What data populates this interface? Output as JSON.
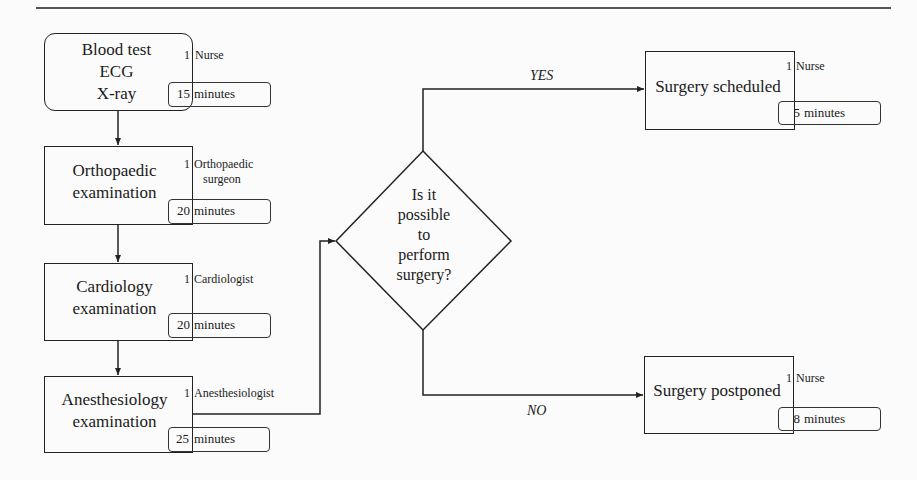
{
  "diagram": {
    "type": "flowchart",
    "steps": [
      {
        "id": "pre-tests",
        "lines": [
          "Blood test",
          "ECG",
          "X-ray"
        ],
        "staff_count": "1",
        "staff_role": "Nurse",
        "duration_value": "15",
        "duration_unit": "minutes"
      },
      {
        "id": "orthopaedic",
        "lines": [
          "Orthopaedic",
          "examination"
        ],
        "staff_count": "1",
        "staff_role_lines": [
          "Orthopaedic",
          "surgeon"
        ],
        "duration_value": "20",
        "duration_unit": "minutes"
      },
      {
        "id": "cardiology",
        "lines": [
          "Cardiology",
          "examination"
        ],
        "staff_count": "1",
        "staff_role": "Cardiologist",
        "duration_value": "20",
        "duration_unit": "minutes"
      },
      {
        "id": "anesthesiology",
        "lines": [
          "Anesthesiology",
          "examination"
        ],
        "staff_count": "1",
        "staff_role": "Anesthesiologist",
        "duration_value": "25",
        "duration_unit": "minutes"
      }
    ],
    "decision": {
      "lines": [
        "Is it",
        "possible",
        "to",
        "perform",
        "surgery?"
      ],
      "yes_label": "YES",
      "no_label": "NO"
    },
    "outcomes": [
      {
        "id": "scheduled",
        "label": "Surgery scheduled",
        "staff_count": "1",
        "staff_role": "Nurse",
        "duration_value": "5",
        "duration_unit": "minutes"
      },
      {
        "id": "postponed",
        "label": "Surgery postponed",
        "staff_count": "1",
        "staff_role": "Nurse",
        "duration_value": "8",
        "duration_unit": "minutes"
      }
    ]
  }
}
